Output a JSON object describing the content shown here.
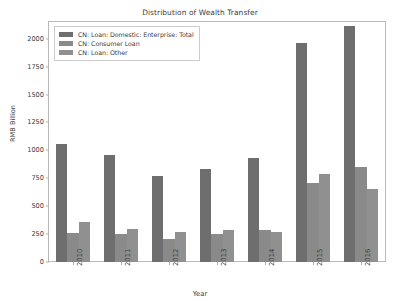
{
  "chart_data": {
    "type": "bar",
    "title": "Distribution of Wealth Transfer",
    "xlabel": "Year",
    "ylabel": "RMB Billion",
    "categories": [
      "2010",
      "2011",
      "2012",
      "2013",
      "2014",
      "2015",
      "2016"
    ],
    "series": [
      {
        "name": "CN: Loan: Domestic: Enterprise: Total",
        "color": "#6e6e6e",
        "values": [
          1055,
          960,
          775,
          835,
          935,
          1965,
          2110
        ]
      },
      {
        "name": "CN: Consumer Loan",
        "color": "#8a8a8a",
        "values": [
          260,
          250,
          210,
          255,
          285,
          705,
          855
        ]
      },
      {
        "name": "CN: Loan: Other",
        "color": "#909090",
        "values": [
          360,
          300,
          265,
          290,
          265,
          785,
          655
        ]
      }
    ],
    "ylim": [
      0,
      2150
    ],
    "yticks": [
      0,
      250,
      500,
      750,
      1000,
      1250,
      1500,
      1750,
      2000
    ],
    "ytick_labels": [
      "0",
      "250",
      "500",
      "750",
      "1000",
      "1250",
      "1500",
      "1750",
      "2000"
    ],
    "grid": false,
    "legend_position": "upper left"
  }
}
